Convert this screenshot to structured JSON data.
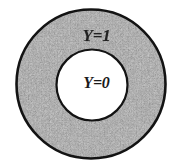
{
  "figure": {
    "type": "annulus-diagram",
    "background_color": "#ffffff",
    "width": 193,
    "height": 167,
    "outer_region": {
      "label": "Y=1",
      "fill": "speckled-gray-texture",
      "fill_color": "#8a8a8a",
      "stroke_color": "#141414",
      "center_x": 91,
      "center_y": 84,
      "radius": 75
    },
    "inner_region": {
      "label": "Y=0",
      "fill_color": "#ffffff",
      "stroke_color": "#141414",
      "center_x": 92,
      "center_y": 85,
      "radius": 36
    }
  }
}
